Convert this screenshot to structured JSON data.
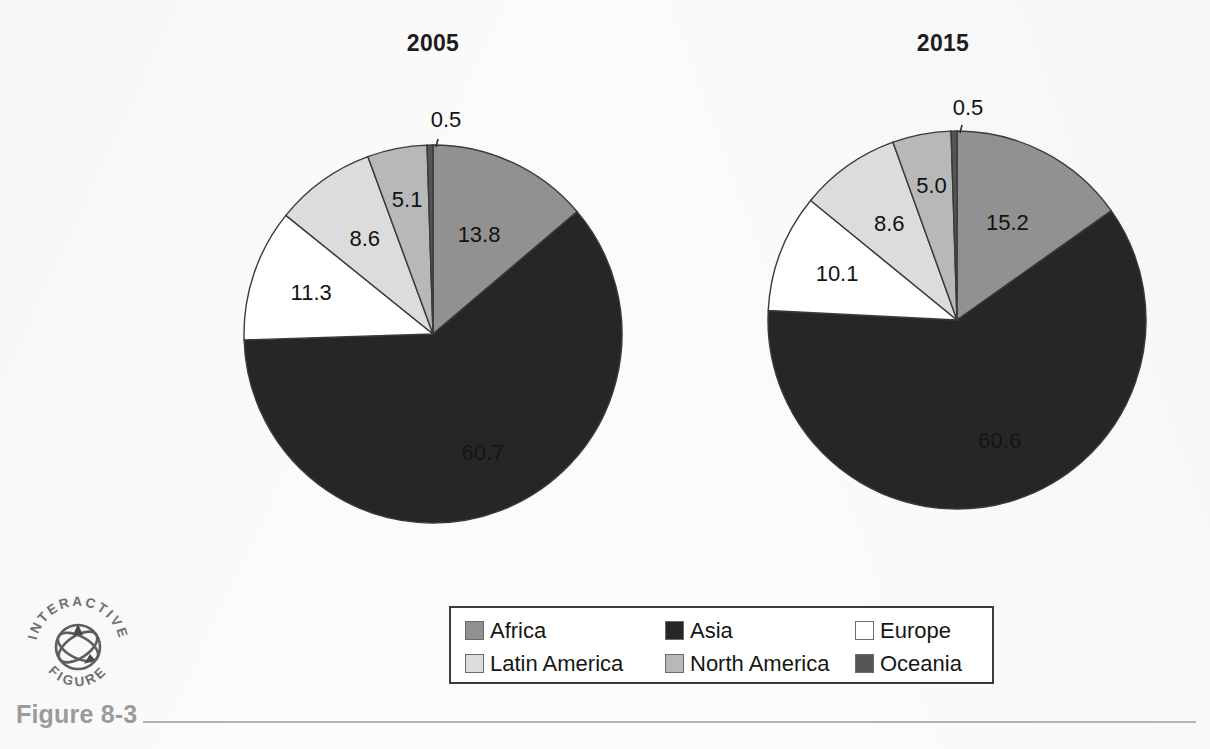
{
  "figure": {
    "caption": "Figure 8-3",
    "logo_line1": "INTERACTIVE",
    "logo_line2": "FIGURE"
  },
  "legend": {
    "items": [
      {
        "label": "Africa",
        "color": "#919191"
      },
      {
        "label": "Asia",
        "color": "#262626"
      },
      {
        "label": "Europe",
        "color": "#ffffff"
      },
      {
        "label": "Latin America",
        "color": "#dcdcdc"
      },
      {
        "label": "North America",
        "color": "#b8b8b8"
      },
      {
        "label": "Oceania",
        "color": "#555555"
      }
    ]
  },
  "chart_data": [
    {
      "type": "pie",
      "title": "2005",
      "labels": [
        "Africa",
        "Asia",
        "Europe",
        "Latin America",
        "North America",
        "Oceania"
      ],
      "values": [
        13.8,
        60.7,
        11.3,
        8.6,
        5.1,
        0.5
      ],
      "colors": [
        "#919191",
        "#262626",
        "#ffffff",
        "#dcdcdc",
        "#b8b8b8",
        "#555555"
      ],
      "value_labels": [
        "13.8",
        "60.7",
        "11.3",
        "8.6",
        "5.1",
        "0.5"
      ],
      "start_angle_deg": 0,
      "direction": "clockwise",
      "units": "percent",
      "legend_position": "bottom"
    },
    {
      "type": "pie",
      "title": "2015",
      "labels": [
        "Africa",
        "Asia",
        "Europe",
        "Latin America",
        "North America",
        "Oceania"
      ],
      "values": [
        15.2,
        60.6,
        10.1,
        8.6,
        5.0,
        0.5
      ],
      "colors": [
        "#919191",
        "#262626",
        "#ffffff",
        "#dcdcdc",
        "#b8b8b8",
        "#555555"
      ],
      "value_labels": [
        "15.2",
        "60.6",
        "10.1",
        "8.6",
        "5.0",
        "0.5"
      ],
      "start_angle_deg": 0,
      "direction": "clockwise",
      "units": "percent",
      "legend_position": "bottom"
    }
  ],
  "pies": [
    {
      "cx": 433,
      "cy": 334,
      "r": 189,
      "callout_x": 446,
      "callout_y": 120,
      "callout_tip_x": 437,
      "callout_tip_y": 150
    },
    {
      "cx": 957,
      "cy": 320,
      "r": 189,
      "callout_x": 968,
      "callout_y": 108,
      "callout_tip_x": 960,
      "callout_tip_y": 136
    }
  ]
}
